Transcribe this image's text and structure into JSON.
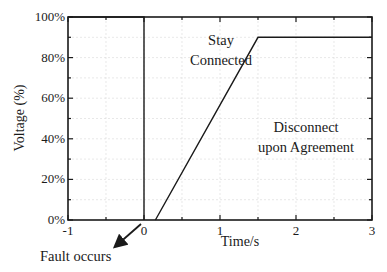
{
  "chart_data": {
    "type": "line",
    "title": "",
    "xlabel": "Time/s",
    "ylabel": "Voltage (%)",
    "xlim": [
      -1,
      3
    ],
    "ylim": [
      0,
      100
    ],
    "x_ticks": [
      -1,
      0,
      1,
      2,
      3
    ],
    "x_tick_labels": [
      "-1",
      "0",
      "1",
      "2",
      "3"
    ],
    "y_ticks": [
      0,
      20,
      40,
      60,
      80,
      100
    ],
    "y_tick_labels": [
      "0%",
      "20%",
      "40%",
      "60%",
      "80%",
      "100%"
    ],
    "grid": true,
    "legend": null,
    "series": [
      {
        "name": "Pre-fault voltage",
        "x": [
          -1,
          0,
          0
        ],
        "y": [
          100,
          100,
          0
        ]
      },
      {
        "name": "LVRT boundary",
        "x": [
          0.15,
          1.5,
          3
        ],
        "y": [
          0,
          90,
          90
        ]
      }
    ],
    "annotations": [
      {
        "text_lines": [
          "Stay",
          "Connected"
        ],
        "x": 1.0,
        "y": 87
      },
      {
        "text_lines": [
          "Disconnect",
          "upon Agreement"
        ],
        "x": 2.25,
        "y": 44
      },
      {
        "text": "Fault occurs",
        "arrow_to": {
          "x": 0,
          "y": 0
        },
        "position": "below-left"
      }
    ]
  }
}
